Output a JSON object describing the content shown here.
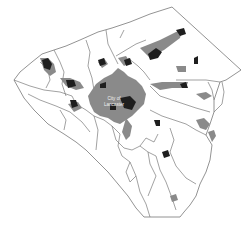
{
  "map": {
    "region": "Lancaster County",
    "labels": {
      "city_line1": "City of",
      "city_line2": "Lancaster"
    },
    "colors": {
      "background": "#ffffff",
      "boundary": "#777777",
      "urban_area": "#8a8a8a",
      "dense_urban": "#1e1e1e",
      "label_text": "#f2f2f2"
    }
  }
}
